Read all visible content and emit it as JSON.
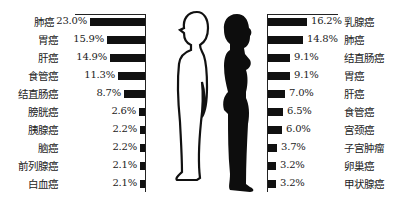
{
  "chart_data": [
    {
      "type": "bar",
      "orientation": "horizontal",
      "title": "",
      "series_name": "male",
      "categories": [
        "肺癌",
        "胃癌",
        "肝癌",
        "食管癌",
        "结直肠癌",
        "膀胱癌",
        "胰腺癌",
        "脑癌",
        "前列腺癌",
        "白血癌"
      ],
      "values": [
        23.0,
        15.9,
        14.9,
        11.3,
        8.7,
        2.6,
        2.2,
        2.2,
        2.1,
        2.1
      ],
      "labels": [
        "23.0%",
        "15.9%",
        "14.9%",
        "11.3%",
        "8.7%",
        "2.6%",
        "2.2%",
        "2.2%",
        "2.1%",
        "2.1%"
      ],
      "bar_direction": "leftward",
      "xlabel": "",
      "ylabel": ""
    },
    {
      "type": "bar",
      "orientation": "horizontal",
      "title": "",
      "series_name": "female",
      "categories": [
        "乳腺癌",
        "肺癌",
        "结直肠癌",
        "胃癌",
        "肝癌",
        "食管癌",
        "宫颈癌",
        "子宫肿瘤",
        "卵巢癌",
        "甲状腺癌"
      ],
      "values": [
        16.2,
        14.8,
        9.1,
        9.1,
        7.0,
        6.5,
        6.0,
        3.7,
        3.2,
        3.2
      ],
      "labels": [
        "16.2%",
        "14.8%",
        "9.1%",
        "9.1%",
        "7.0%",
        "6.5%",
        "6.0%",
        "3.7%",
        "3.2%",
        "3.2%"
      ],
      "bar_direction": "rightward",
      "xlabel": "",
      "ylabel": ""
    }
  ],
  "male": {
    "rows": [
      {
        "name": "肺癌",
        "pct": "23.0%",
        "value": 23.0
      },
      {
        "name": "胃癌",
        "pct": "15.9%",
        "value": 15.9
      },
      {
        "name": "肝癌",
        "pct": "14.9%",
        "value": 14.9
      },
      {
        "name": "食管癌",
        "pct": "11.3%",
        "value": 11.3
      },
      {
        "name": "结直肠癌",
        "pct": "8.7%",
        "value": 8.7
      },
      {
        "name": "膀胱癌",
        "pct": "2.6%",
        "value": 2.6
      },
      {
        "name": "胰腺癌",
        "pct": "2.2%",
        "value": 2.2
      },
      {
        "name": "脑癌",
        "pct": "2.2%",
        "value": 2.2
      },
      {
        "name": "前列腺癌",
        "pct": "2.1%",
        "value": 2.1
      },
      {
        "name": "白血癌",
        "pct": "2.1%",
        "value": 2.1
      }
    ]
  },
  "female": {
    "rows": [
      {
        "name": "乳腺癌",
        "pct": "16.2%",
        "value": 16.2
      },
      {
        "name": "肺癌",
        "pct": "14.8%",
        "value": 14.8
      },
      {
        "name": "结直肠癌",
        "pct": "9.1%",
        "value": 9.1
      },
      {
        "name": "胃癌",
        "pct": "9.1%",
        "value": 9.1
      },
      {
        "name": "肝癌",
        "pct": "7.0%",
        "value": 7.0
      },
      {
        "name": "食管癌",
        "pct": "6.5%",
        "value": 6.5
      },
      {
        "name": "宫颈癌",
        "pct": "6.0%",
        "value": 6.0
      },
      {
        "name": "子宫肿瘤",
        "pct": "3.7%",
        "value": 3.7
      },
      {
        "name": "卵巢癌",
        "pct": "3.2%",
        "value": 3.2
      },
      {
        "name": "甲状腺癌",
        "pct": "3.2%",
        "value": 3.2
      }
    ]
  },
  "colors": {
    "bar": "#111111",
    "female_silhouette": "#0d0d0d",
    "male_silhouette_fill": "#ffffff",
    "male_silhouette_stroke": "#111111"
  }
}
